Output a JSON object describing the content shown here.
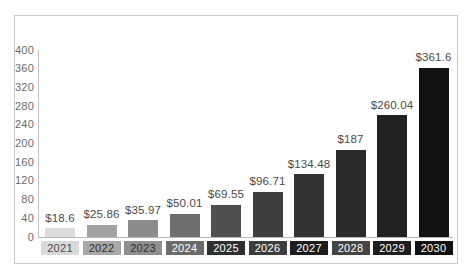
{
  "chart_data": {
    "type": "bar",
    "title": "",
    "subtitle": "",
    "xlabel": "",
    "ylabel": "",
    "categories": [
      "2021",
      "2022",
      "2023",
      "2024",
      "2025",
      "2026",
      "2027",
      "2028",
      "2029",
      "2030"
    ],
    "values": [
      18.6,
      25.86,
      35.97,
      50.01,
      69.55,
      96.71,
      134.48,
      187,
      260.04,
      361.6
    ],
    "value_labels": [
      "$18.6",
      "$25.86",
      "$35.97",
      "$50.01",
      "$69.55",
      "$96.71",
      "$134.48",
      "$187",
      "$260.04",
      "$361.6"
    ],
    "ylim": [
      0,
      400
    ],
    "y_ticks": [
      0,
      40,
      80,
      120,
      160,
      200,
      240,
      280,
      320,
      360,
      400
    ],
    "y_tick_labels": [
      "0",
      "40",
      "80",
      "120",
      "160",
      "200",
      "240",
      "280",
      "320",
      "360",
      "400"
    ],
    "grid": false,
    "legend": false,
    "legend_position": "none",
    "bar_colors": [
      "#dcdcdc",
      "#a3a3a3",
      "#8c8c8c",
      "#6e6e6e",
      "#4f4f4f",
      "#3f3f3f",
      "#333333",
      "#2b2b2b",
      "#222222",
      "#121212"
    ],
    "category_label_bg": [
      "#d9d9d9",
      "#a8a8a8",
      "#8f8f8f",
      "#6b6b6b",
      "#2f2f2f",
      "#3d3d3d",
      "#1c1c1c",
      "#454545",
      "#1e1e1e",
      "#111111"
    ],
    "category_label_fg": [
      "#4a4a4a",
      "#2e2e2e",
      "#2e2e2e",
      "#ffffff",
      "#ffffff",
      "#ffffff",
      "#ffffff",
      "#ffffff",
      "#ffffff",
      "#ffffff"
    ],
    "axis_color": "#b8b8b8",
    "tick_text_color": "#6b6b6b",
    "value_text_color": "#4a4a4a",
    "frame_border_color": "#c9c9c9",
    "background_color": "#ffffff"
  }
}
